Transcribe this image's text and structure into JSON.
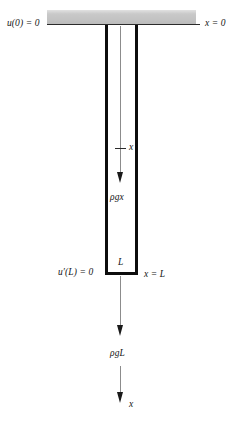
{
  "figure": {
    "type": "free-body-diagram",
    "support": {
      "icon_name": "fixed-support-block",
      "fill": "#c9c9c9"
    },
    "bar": {
      "stroke": "#0d0d0d",
      "centerline": "#8c8c8c"
    }
  },
  "labels": {
    "u_at_0": "u(0) = 0",
    "x_at_0": "x = 0",
    "x_tick": "x",
    "rho_g_x": "ρgx",
    "u_prime_at_L": "u′(L) = 0",
    "L": "L",
    "x_at_L": "x = L",
    "rho_g_L": "ρgL",
    "x_axis": "x"
  },
  "icons": {
    "arrow_rho_g_x": "arrow-down-icon",
    "arrow_rho_g_L": "arrow-down-icon",
    "arrow_x_axis": "arrow-down-icon",
    "tick_x": "tick-mark-icon"
  }
}
